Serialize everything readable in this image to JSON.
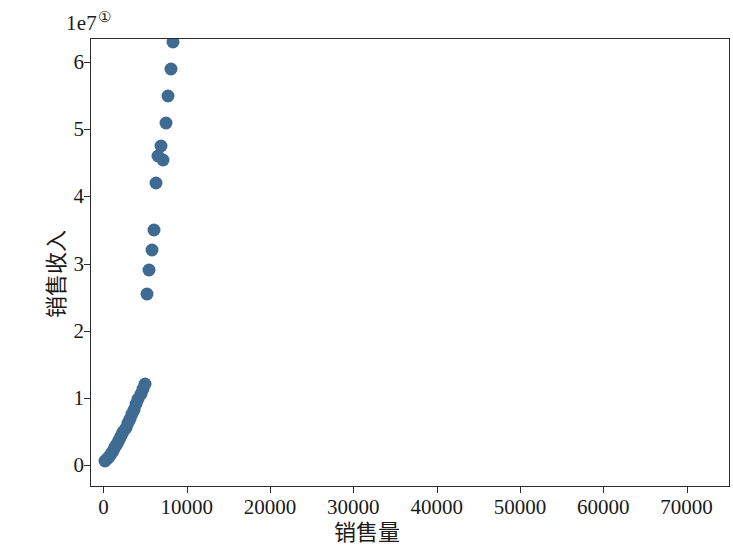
{
  "chart_data": {
    "type": "scatter",
    "title": "",
    "xlabel": "销售量",
    "ylabel": "销售收入",
    "offset_text": "1e7",
    "footnote_marker": "①",
    "grid": false,
    "legend": null,
    "marker_color": "#3f6b93",
    "xlim": [
      -1500,
      75100
    ],
    "ylim": [
      -0.32,
      6.35
    ],
    "y_scale_note": "y values are in units of 1e7",
    "xticks": [
      0,
      10000,
      20000,
      30000,
      40000,
      50000,
      60000,
      70000
    ],
    "xticklabels": [
      "0",
      "10000",
      "20000",
      "30000",
      "40000",
      "50000",
      "60000",
      "70000"
    ],
    "yticks": [
      0,
      1,
      2,
      3,
      4,
      5,
      6
    ],
    "yticklabels": [
      "0",
      "1",
      "2",
      "3",
      "4",
      "5",
      "6"
    ],
    "points": [
      [
        200,
        0.05
      ],
      [
        420,
        0.08
      ],
      [
        650,
        0.12
      ],
      [
        900,
        0.16
      ],
      [
        1150,
        0.2
      ],
      [
        1400,
        0.26
      ],
      [
        1650,
        0.3
      ],
      [
        1900,
        0.36
      ],
      [
        2150,
        0.42
      ],
      [
        2400,
        0.48
      ],
      [
        2700,
        0.55
      ],
      [
        2950,
        0.62
      ],
      [
        3200,
        0.68
      ],
      [
        3450,
        0.75
      ],
      [
        3700,
        0.82
      ],
      [
        3950,
        0.9
      ],
      [
        4200,
        0.98
      ],
      [
        4500,
        1.05
      ],
      [
        4750,
        1.12
      ],
      [
        5000,
        1.2
      ],
      [
        5200,
        2.55
      ],
      [
        5500,
        2.9
      ],
      [
        5800,
        3.2
      ],
      [
        6100,
        3.5
      ],
      [
        6300,
        4.2
      ],
      [
        6600,
        4.6
      ],
      [
        6900,
        4.75
      ],
      [
        7200,
        4.55
      ],
      [
        7500,
        5.1
      ],
      [
        7800,
        5.5
      ],
      [
        8100,
        5.9
      ],
      [
        8400,
        6.3
      ],
      [
        8700,
        6.8
      ],
      [
        9000,
        7.3
      ],
      [
        9300,
        7.8
      ],
      [
        9600,
        8.3
      ],
      [
        9900,
        8.8
      ],
      [
        10200,
        9.4
      ],
      [
        10500,
        9.9
      ],
      [
        10300,
        6.7
      ],
      [
        10800,
        6.9
      ],
      [
        11100,
        10.6
      ],
      [
        11500,
        11.1
      ],
      [
        11900,
        11.6
      ],
      [
        12400,
        12.5
      ],
      [
        12900,
        12.9
      ],
      [
        13300,
        10.9
      ],
      [
        13600,
        11.6
      ],
      [
        16200,
        13.0
      ],
      [
        19700,
        15.2
      ],
      [
        20600,
        15.5
      ],
      [
        22100,
        14.9
      ],
      [
        22900,
        13.9
      ],
      [
        23500,
        17.9
      ],
      [
        26700,
        24.8
      ],
      [
        27100,
        25.9
      ],
      [
        30400,
        30.7
      ],
      [
        32900,
        19.6
      ],
      [
        33600,
        25.3
      ],
      [
        36700,
        28.4
      ],
      [
        37600,
        38.9
      ],
      [
        40300,
        26.5
      ],
      [
        64500,
        36.7
      ],
      [
        72800,
        58.2
      ]
    ]
  }
}
